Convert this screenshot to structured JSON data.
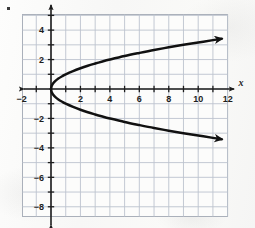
{
  "figure": {
    "corner_marker": "bullet-dot",
    "background_color": "#fbfbfa"
  },
  "chart_data": {
    "type": "line",
    "title": "",
    "subtitle": "",
    "xlabel": "x",
    "ylabel": "",
    "equation": "x = y²",
    "grid": true,
    "grid_color": "#b9c0cb",
    "axis_color": "#1d1d1d",
    "curve_color": "#111111",
    "legend": null,
    "legend_position": "none",
    "xlim": [
      -2.0,
      12.5
    ],
    "ylim": [
      -8.7,
      5.0
    ],
    "x_ticks": [
      -2,
      0,
      2,
      4,
      6,
      8,
      10,
      12
    ],
    "x_tick_labels": [
      "−2",
      "",
      "2",
      "4",
      "6",
      "8",
      "10",
      "12"
    ],
    "y_ticks": [
      4,
      2,
      0,
      -2,
      -4,
      -6,
      -8
    ],
    "y_tick_labels": [
      "4",
      "2",
      "",
      "−2",
      "−4",
      "−6",
      "−8"
    ],
    "x_minor_step": 1,
    "y_minor_step": 1,
    "x_axis_arrows": [
      "left",
      "right"
    ],
    "y_axis_arrows": [
      "up",
      "down"
    ],
    "series": [
      {
        "name": "upper branch: y = √x",
        "arrow_end": "right",
        "points": [
          [
            0.0,
            0.0
          ],
          [
            0.05,
            0.22
          ],
          [
            0.15,
            0.39
          ],
          [
            0.3,
            0.55
          ],
          [
            0.5,
            0.71
          ],
          [
            0.8,
            0.89
          ],
          [
            1.0,
            1.0
          ],
          [
            1.5,
            1.22
          ],
          [
            2.0,
            1.41
          ],
          [
            2.5,
            1.58
          ],
          [
            3.0,
            1.73
          ],
          [
            3.5,
            1.87
          ],
          [
            4.0,
            2.0
          ],
          [
            5.0,
            2.24
          ],
          [
            6.0,
            2.45
          ],
          [
            7.0,
            2.65
          ],
          [
            8.0,
            2.83
          ],
          [
            9.0,
            3.0
          ],
          [
            10.0,
            3.16
          ],
          [
            11.0,
            3.32
          ],
          [
            11.6,
            3.41
          ]
        ]
      },
      {
        "name": "lower branch: y = −√x",
        "arrow_end": "right",
        "points": [
          [
            0.0,
            0.0
          ],
          [
            0.05,
            -0.22
          ],
          [
            0.15,
            -0.39
          ],
          [
            0.3,
            -0.55
          ],
          [
            0.5,
            -0.71
          ],
          [
            0.8,
            -0.89
          ],
          [
            1.0,
            -1.0
          ],
          [
            1.5,
            -1.22
          ],
          [
            2.0,
            -1.41
          ],
          [
            2.5,
            -1.58
          ],
          [
            3.0,
            -1.73
          ],
          [
            3.5,
            -1.87
          ],
          [
            4.0,
            -2.0
          ],
          [
            5.0,
            -2.24
          ],
          [
            6.0,
            -2.45
          ],
          [
            7.0,
            -2.65
          ],
          [
            8.0,
            -2.83
          ],
          [
            9.0,
            -3.0
          ],
          [
            10.0,
            -3.16
          ],
          [
            11.0,
            -3.32
          ],
          [
            11.6,
            -3.41
          ]
        ]
      }
    ]
  }
}
